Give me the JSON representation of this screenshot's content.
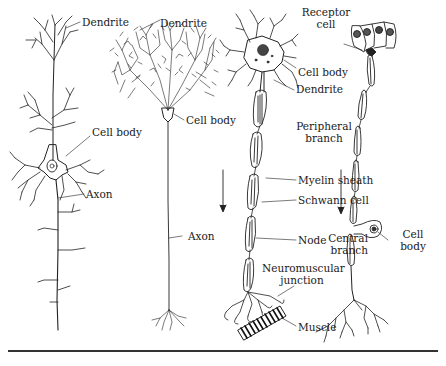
{
  "figure": {
    "neurons": [
      {
        "id": "pyramidal",
        "labels": {
          "dendrite": "Dendrite",
          "cell_body": "Cell body",
          "axon": "Axon"
        }
      },
      {
        "id": "purkinje",
        "labels": {
          "dendrite": "Dendrite",
          "cell_body": "Cell body",
          "axon": "Axon"
        }
      },
      {
        "id": "motor",
        "labels": {
          "cell_body": "Cell body",
          "dendrite": "Dendrite",
          "myelin_sheath": "Myelin sheath",
          "schwann_cell": "Schwann cell",
          "node": "Node",
          "neuromuscular_junction_1": "Neuromuscular",
          "neuromuscular_junction_2": "junction",
          "muscle": "Muscle"
        }
      },
      {
        "id": "sensory",
        "labels": {
          "receptor_cell_1": "Receptor",
          "receptor_cell_2": "cell",
          "peripheral_branch_1": "Peripheral",
          "peripheral_branch_2": "branch",
          "central_branch_1": "Central",
          "central_branch_2": "branch",
          "cell_body_1": "Cell",
          "cell_body_2": "body"
        }
      }
    ],
    "arrows": [
      {
        "name": "signal-direction-arrow-1",
        "direction": "down"
      },
      {
        "name": "signal-direction-arrow-2",
        "direction": "down"
      }
    ],
    "colors": {
      "ink": "#1a1a1a",
      "background": "#ffffff"
    }
  }
}
